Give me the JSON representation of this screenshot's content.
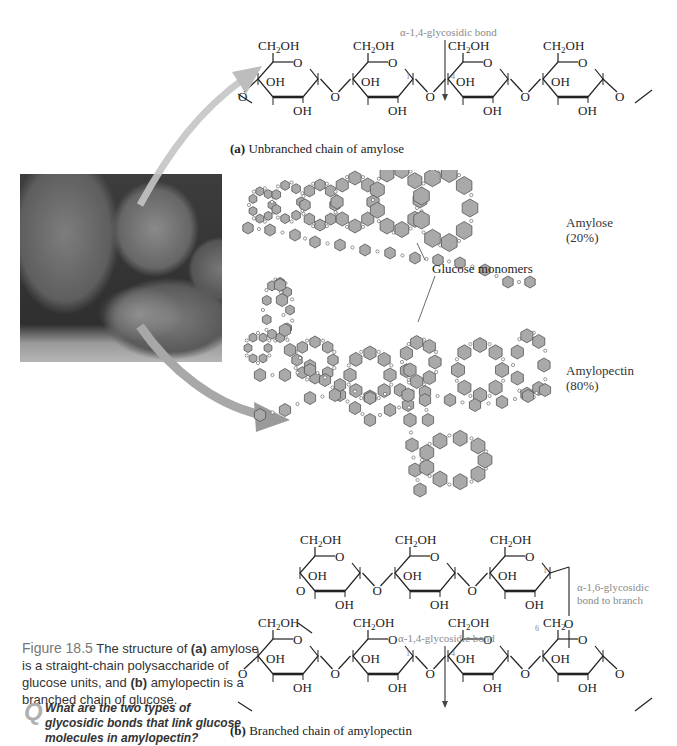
{
  "figure": {
    "number": "Figure 18.5",
    "caption_parts": {
      "intro": " The structure of ",
      "a_marker": "(a)",
      "a_text": " amylose is a straight-chain polysaccharide of glucose units, and ",
      "b_marker": "(b)",
      "b_text": " amylopectin is a branched chain of glucose."
    },
    "question_icon": "Q",
    "question": "What are the two types of glycosidic bonds that link glucose molecules in amylopectin?"
  },
  "panel_a": {
    "marker": "(a)",
    "title": " Unbranched chain of amylose",
    "bond_label": "α-1,4-glycosidic bond",
    "group_labels": {
      "ch2oh": "CH2OH",
      "oh": "OH",
      "o": "O",
      "c1": "1",
      "c4": "4"
    },
    "ring_count": 4
  },
  "panel_b": {
    "marker": "(b)",
    "title": " Branched chain of amylopectin",
    "bond_14_label": "α-1,4-glycosidic bond",
    "bond_16_label_line1": "α-1,6-glycosidic",
    "bond_16_label_line2": "bond to branch",
    "group_labels": {
      "ch2oh": "CH2OH",
      "ch2": "CH2",
      "oh": "OH",
      "o": "O",
      "c1": "1",
      "c4": "4",
      "c6": "6"
    },
    "upper_ring_count": 3,
    "lower_ring_count": 4
  },
  "middle": {
    "glucose_label": "Glucose monomers",
    "amylose_label": "Amylose",
    "amylose_pct": "(20%)",
    "amylopectin_label": "Amylopectin",
    "amylopectin_pct": "(80%)"
  },
  "photo": {
    "subject": "potatoes",
    "icon": "potato-photo"
  },
  "colors": {
    "ring_fill": "#a9a9a9",
    "ring_stroke": "#555555",
    "arrow": "#b8b8b8",
    "label_gray": "#8a8a8a",
    "text": "#222222"
  }
}
